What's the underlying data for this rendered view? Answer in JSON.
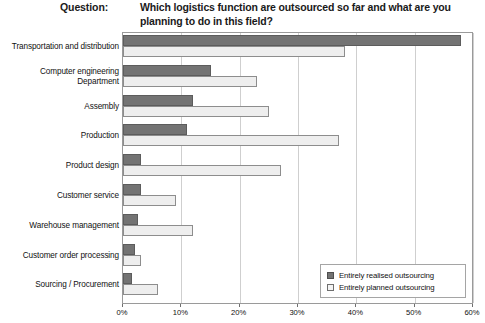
{
  "header": {
    "question_label": "Question:",
    "question_text": "Which logistics function are outsourced so far and what are you planning to do in this field?"
  },
  "legend": {
    "items": [
      {
        "label": "Entirely realised outsourcing",
        "swatch": "dark-gray-square-icon",
        "color": "#737373"
      },
      {
        "label": "Entirely planned outsourcing",
        "swatch": "light-gray-square-icon",
        "color": "#eeeeee"
      }
    ]
  },
  "chart_data": {
    "type": "bar",
    "orientation": "horizontal",
    "title": "Which logistics function are outsourced so far and what are you planning to do in this field?",
    "xlabel": "",
    "ylabel": "",
    "xlim": [
      0,
      60
    ],
    "xticks": [
      0,
      10,
      20,
      30,
      40,
      50,
      60
    ],
    "xticklabels": [
      "0%",
      "10%",
      "20%",
      "30%",
      "40%",
      "50%",
      "60%"
    ],
    "grid": true,
    "legend_position": "bottom-right",
    "categories": [
      "Transportation and distribution",
      "Computer engineering Department",
      "Assembly",
      "Production",
      "Product design",
      "Customer service",
      "Warehouse management",
      "Customer order processing",
      "Sourcing / Procurement"
    ],
    "series": [
      {
        "name": "Entirely realised outsourcing",
        "color": "#737373",
        "values": [
          58,
          15,
          12,
          11,
          3,
          3,
          2.5,
          2,
          1.5
        ]
      },
      {
        "name": "Entirely planned outsourcing",
        "color": "#eeeeee",
        "values": [
          38,
          23,
          25,
          37,
          27,
          9,
          12,
          3,
          6
        ]
      }
    ]
  }
}
